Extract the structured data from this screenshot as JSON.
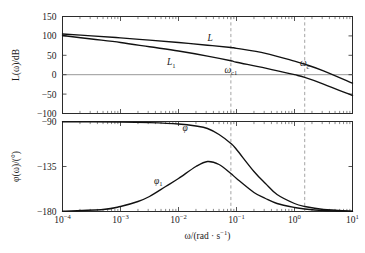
{
  "chart_data": {
    "type": "line",
    "title": "",
    "subtitle": "",
    "xlabel": "ω/(rad · s⁻¹)",
    "xlabel_parts": {
      "base": "ω/(rad · s",
      "sup": "−1",
      "tail": ")"
    },
    "x_scale": "log",
    "xlim": [
      0.0001,
      10
    ],
    "x_ticklabels": [
      {
        "mantissa": "10",
        "exponent": "−4",
        "value": 0.0001
      },
      {
        "mantissa": "10",
        "exponent": "−3",
        "value": 0.001
      },
      {
        "mantissa": "10",
        "exponent": "−2",
        "value": 0.01
      },
      {
        "mantissa": "10",
        "exponent": "−1",
        "value": 0.1
      },
      {
        "mantissa": "10",
        "exponent": "0",
        "value": 1
      },
      {
        "mantissa": "10",
        "exponent": "1",
        "value": 10
      }
    ],
    "panels": [
      {
        "id": "magnitude",
        "ylabel": "L(ω)/dB",
        "ylabel_parts": {
          "pre": "L(ω)/dB"
        },
        "ylim": [
          -100,
          150
        ],
        "y_ticks": [
          150,
          100,
          50,
          0,
          -50,
          -100
        ],
        "y_ticklabels": [
          "150",
          "100",
          "50",
          "0",
          "−50",
          "−100"
        ],
        "grid": false,
        "zero_reference_line": 0,
        "series": [
          {
            "name": "L",
            "label": "L",
            "label_sub": "",
            "x": [
              0.0001,
              0.000316,
              0.001,
              0.00316,
              0.01,
              0.0316,
              0.08,
              0.1,
              0.316,
              1,
              1.5,
              3.16,
              10
            ],
            "y": [
              105,
              100,
              95,
              89,
              83,
              76,
              70,
              68,
              55,
              35,
              27,
              10,
              -22
            ]
          },
          {
            "name": "L1",
            "label": "L",
            "label_sub": "1",
            "x": [
              0.0001,
              0.000316,
              0.001,
              0.00316,
              0.01,
              0.0316,
              0.08,
              0.1,
              0.316,
              1,
              1.5,
              3.16,
              10
            ],
            "y": [
              101,
              92,
              83,
              72,
              61,
              48,
              36,
              32,
              17,
              0,
              -7,
              -24,
              -54
            ]
          }
        ],
        "annotations": [
          {
            "name": "omega-c1-label",
            "text": "ω",
            "sub": "c1",
            "x": 0.08,
            "y": 5,
            "role": "crossover-marker"
          },
          {
            "name": "omega-c-label",
            "text": "ω",
            "sub": "c",
            "x": 1.5,
            "y": 22,
            "role": "crossover-marker"
          }
        ]
      },
      {
        "id": "phase",
        "ylabel": "φ(ω)/(°)",
        "ylim": [
          -180,
          -90
        ],
        "y_ticks": [
          -90,
          -135,
          -180
        ],
        "y_ticklabels": [
          "−90",
          "−135",
          "−180"
        ],
        "grid": false,
        "series": [
          {
            "name": "phi",
            "label": "φ",
            "label_sub": "",
            "x": [
              0.0001,
              0.001,
              0.00316,
              0.01,
              0.02,
              0.0316,
              0.05,
              0.08,
              0.1,
              0.2,
              0.316,
              0.5,
              1,
              1.5,
              3.16,
              10
            ],
            "y": [
              -90.3,
              -90.6,
              -91.2,
              -92.5,
              -94.5,
              -97,
              -103,
              -112,
              -118,
              -140,
              -152,
              -163,
              -172,
              -175,
              -178,
              -179.6
            ]
          },
          {
            "name": "phi1",
            "label": "φ",
            "label_sub": "1",
            "x": [
              0.0001,
              0.0005,
              0.001,
              0.002,
              0.00316,
              0.006,
              0.01,
              0.02,
              0.0316,
              0.05,
              0.08,
              0.1,
              0.2,
              0.316,
              0.5,
              1,
              1.5,
              3.16,
              10
            ],
            "y": [
              -179.6,
              -178,
              -175,
              -170,
              -165,
              -155,
              -147,
              -135,
              -130,
              -133,
              -142,
              -147,
              -161,
              -167,
              -172,
              -176,
              -177.5,
              -179,
              -179.8
            ]
          }
        ],
        "annotations": [
          {
            "name": "phi-label",
            "text": "φ",
            "sub": "",
            "x": 0.013,
            "y": -99,
            "role": "curve-label"
          },
          {
            "name": "phi1-label",
            "text": "φ",
            "sub": "1",
            "x": 0.0045,
            "y": -152,
            "role": "curve-label"
          }
        ]
      }
    ],
    "vertical_markers": [
      {
        "name": "omega-c1-line",
        "value": 0.08,
        "style": "dashed"
      },
      {
        "name": "omega-c-line",
        "value": 1.5,
        "style": "dashed"
      }
    ],
    "colors": {
      "curve": "#111111",
      "frame": "#2b2b2b",
      "zero_line": "#8c8c8c",
      "dashed_marker": "#9a9a9a",
      "background": "#ffffff"
    }
  }
}
